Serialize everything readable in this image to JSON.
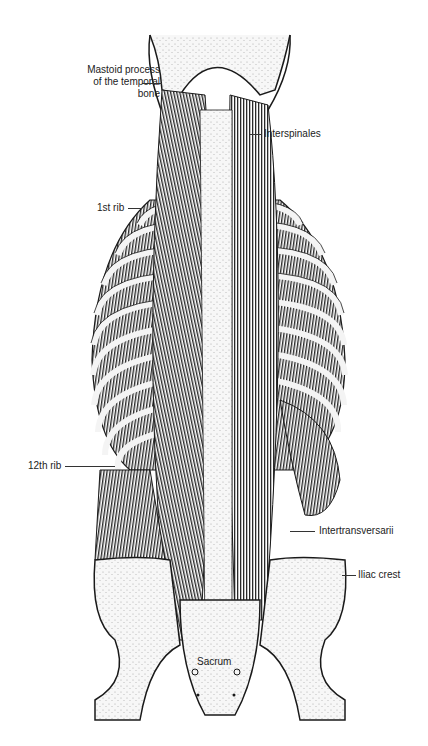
{
  "figure": {
    "colors": {
      "ink": "#1a1a1a",
      "bone": "#f4f4f4",
      "muscle": "#333333",
      "background": "#ffffff"
    }
  },
  "labels": {
    "mastoid_line1": "Mastoid process",
    "mastoid_line2": "of the temporal",
    "mastoid_line3": "bone",
    "interspinales": "Interspinales",
    "first_rib": "1st rib",
    "twelfth_rib": "12th rib",
    "intertransversarii": "Intertransversarii",
    "iliac_crest": "Iliac crest",
    "sacrum": "Sacrum"
  }
}
